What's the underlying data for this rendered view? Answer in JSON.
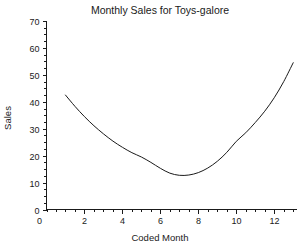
{
  "chart_data": {
    "type": "line",
    "title": "Monthly Sales for Toys-galore",
    "xlabel": "Coded Month",
    "ylabel": "Sales",
    "xlim": [
      0,
      13.2
    ],
    "ylim": [
      0,
      70
    ],
    "grid": false,
    "legend": null,
    "x_ticks": [
      2,
      4,
      6,
      8,
      10,
      12
    ],
    "x_tick_labels": [
      "2",
      "4",
      "6",
      "8",
      "10",
      "12"
    ],
    "x_minor_step": 0.5,
    "y_ticks": [
      0,
      10,
      20,
      30,
      40,
      50,
      60,
      70
    ],
    "y_tick_labels": [
      "0",
      "10",
      "20",
      "30",
      "40",
      "50",
      "60",
      "70"
    ],
    "y_minor_step": 2.5,
    "series": [
      {
        "name": "Sales",
        "color": "#1a1a1a",
        "x": [
          1.0,
          1.5,
          2.0,
          2.5,
          3.0,
          3.5,
          4.0,
          4.5,
          5.0,
          5.5,
          6.0,
          6.5,
          7.0,
          7.5,
          8.0,
          8.5,
          9.0,
          9.5,
          10.0,
          10.5,
          11.0,
          11.5,
          12.0,
          12.5,
          13.0
        ],
        "values": [
          42.5,
          38.3,
          34.5,
          31.1,
          28.1,
          25.4,
          23.1,
          21.1,
          19.5,
          17.5,
          15.3,
          13.5,
          12.7,
          12.8,
          13.7,
          15.4,
          17.9,
          21.2,
          25.3,
          28.5,
          32.3,
          36.5,
          41.5,
          47.5,
          54.5
        ]
      }
    ],
    "annotations": []
  }
}
